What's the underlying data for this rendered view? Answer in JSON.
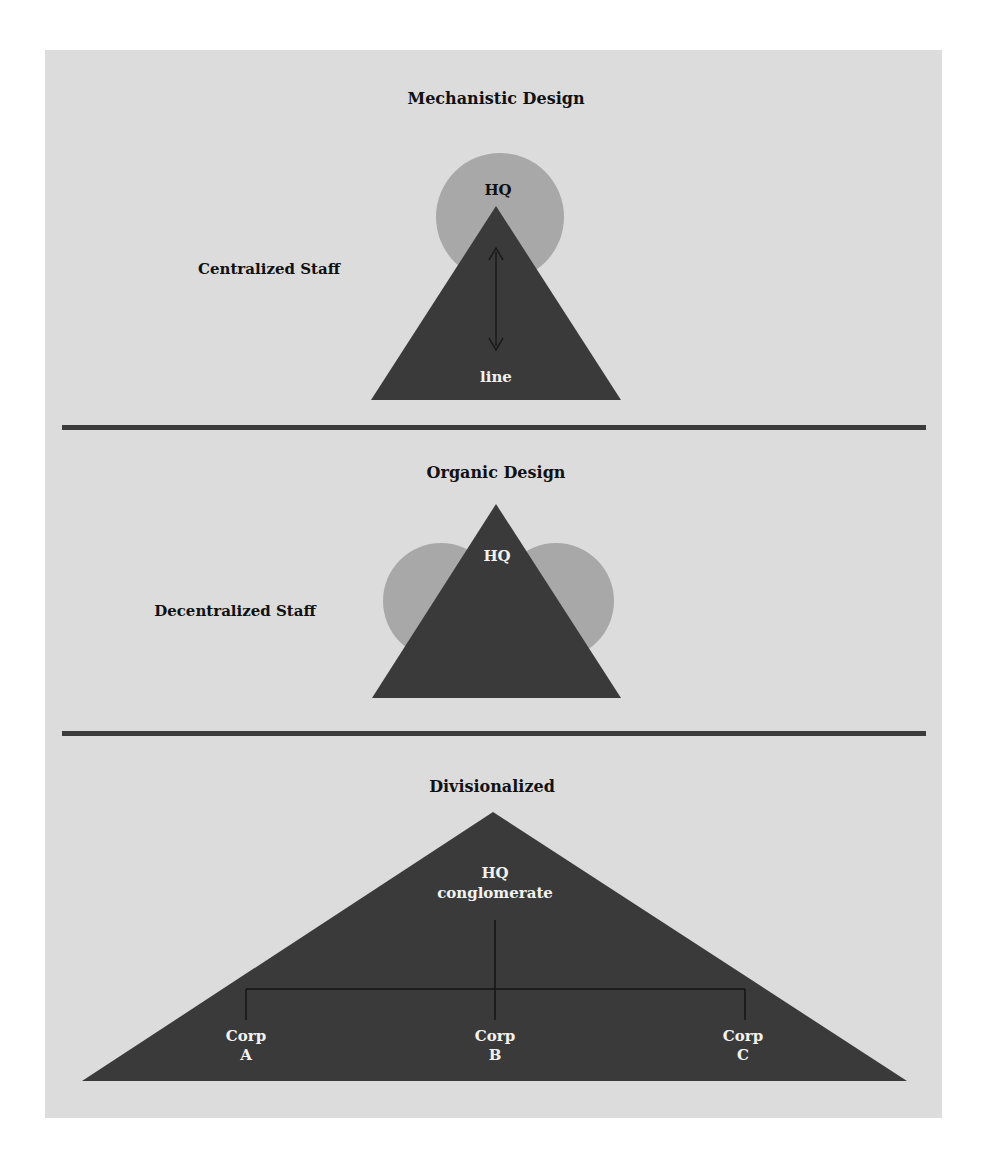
{
  "colors": {
    "page_background": "#ffffff",
    "panel_background": "#dcdcdc",
    "triangle_fill": "#3a3a3a",
    "staff_circle_fill": "#a8a8a8",
    "divider": "#3c3c3c",
    "dark_text": "#111111",
    "light_text": "#f2f2f2"
  },
  "sections": [
    {
      "title": "Mechanistic Design",
      "side_label": "Centralized Staff",
      "hq_label": "HQ",
      "line_label": "line"
    },
    {
      "title": "Organic Design",
      "side_label": "Decentralized Staff",
      "hq_label": "HQ"
    },
    {
      "title": "Divisionalized",
      "hq_label": "HQ",
      "hq_sublabel": "conglomerate",
      "divisions": [
        {
          "label": "Corp",
          "letter": "A"
        },
        {
          "label": "Corp",
          "letter": "B"
        },
        {
          "label": "Corp",
          "letter": "C"
        }
      ]
    }
  ]
}
